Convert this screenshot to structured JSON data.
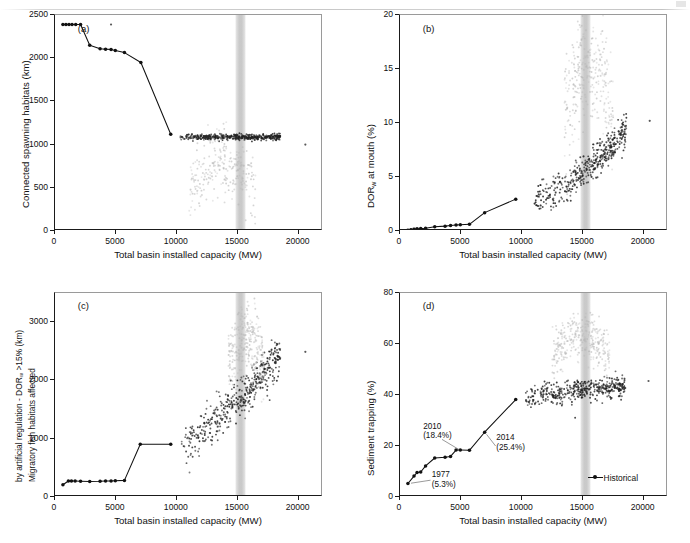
{
  "figure": {
    "width": 690,
    "height": 543,
    "background": "#ffffff",
    "shared_xlabel": "Total basin installed capacity (MW)",
    "legend_label": "Historical",
    "band_color": "#bcbcbc",
    "line_color": "#111111",
    "scatter_dark": "#222222",
    "scatter_light": "#b8b8b8"
  },
  "chart_data": [
    {
      "type": "scatter",
      "panel": "a",
      "tag": "(a)",
      "title": "",
      "xlabel": "Total basin installed capacity (MW)",
      "ylabel": "Connected spawning habitats (km)",
      "xlim": [
        0,
        22000
      ],
      "ylim": [
        0,
        2500
      ],
      "xticks": [
        0,
        5000,
        10000,
        15000,
        20000
      ],
      "xticklabels": [
        "0",
        "5000",
        "10000",
        "15000",
        "20000"
      ],
      "yticks": [
        0,
        500,
        1000,
        1500,
        2000,
        2500
      ],
      "yticklabels": [
        "0",
        "500",
        "1000",
        "1500",
        "2000",
        "2500"
      ],
      "grid": false,
      "legend": false,
      "highlight_band": [
        14800,
        15700
      ],
      "series": [
        {
          "name": "Historical",
          "style": "line-marker",
          "x": [
            650,
            900,
            1150,
            1400,
            1700,
            2100,
            2850,
            3700,
            4150,
            4600,
            4950,
            5700,
            7050,
            9500
          ],
          "y": [
            2390,
            2390,
            2390,
            2390,
            2390,
            2390,
            2150,
            2110,
            2105,
            2100,
            2090,
            2065,
            1950,
            1120
          ]
        },
        {
          "name": "Scenario ensemble (dense band)",
          "style": "scatter-dark",
          "x_range": [
            10200,
            18500
          ],
          "y_range": [
            980,
            1130
          ],
          "n": 420
        },
        {
          "name": "Scenario ensemble (diffuse)",
          "style": "scatter-light",
          "x_range": [
            11000,
            16500
          ],
          "y_range": [
            60,
            980
          ],
          "n": 260
        }
      ],
      "outliers": [
        {
          "x": 4600,
          "y": 2390
        },
        {
          "x": 20550,
          "y": 1000
        }
      ]
    },
    {
      "type": "scatter",
      "panel": "b",
      "tag": "(b)",
      "title": "",
      "xlabel": "Total basin installed capacity (MW)",
      "ylabel": "DORw at mouth (%)",
      "ylabel_base": "DOR",
      "ylabel_sub": "w",
      "ylabel_rest": " at mouth (%)",
      "xlim": [
        0,
        22000
      ],
      "ylim": [
        0,
        20
      ],
      "xticks": [
        0,
        5000,
        10000,
        15000,
        20000
      ],
      "xticklabels": [
        "0",
        "5000",
        "10000",
        "15000",
        "20000"
      ],
      "yticks": [
        0,
        5,
        10,
        15,
        20
      ],
      "yticklabels": [
        "0",
        "5",
        "10",
        "15",
        "20"
      ],
      "grid": false,
      "legend": false,
      "highlight_band": [
        14800,
        15700
      ],
      "series": [
        {
          "name": "Historical",
          "style": "line-marker",
          "x": [
            650,
            900,
            1150,
            1400,
            1700,
            2100,
            2850,
            3700,
            4150,
            4600,
            4950,
            5700,
            6950,
            9500
          ],
          "y": [
            0.08,
            0.12,
            0.16,
            0.2,
            0.22,
            0.26,
            0.4,
            0.45,
            0.5,
            0.55,
            0.58,
            0.62,
            1.7,
            2.95
          ]
        },
        {
          "name": "Scenario ensemble (dense)",
          "style": "scatter-dark",
          "x_range": [
            11000,
            18600
          ],
          "y_range": [
            3.0,
            9.5
          ],
          "n": 430
        },
        {
          "name": "Scenario ensemble (diffuse upper)",
          "style": "scatter-light",
          "x_range": [
            13500,
            17500
          ],
          "y_range": [
            6.0,
            18.0
          ],
          "n": 300
        }
      ],
      "outliers": [
        {
          "x": 20500,
          "y": 10.2
        }
      ]
    },
    {
      "type": "scatter",
      "panel": "c",
      "tag": "(c)",
      "title": "",
      "xlabel": "Total basin installed capacity (MW)",
      "ylabel_line1": "Migratory fish habitats affected",
      "ylabel_line2": "by artificial regulation - DORw >15% (km)",
      "ylabel_line2_base": "by artificial regulation - DOR",
      "ylabel_line2_sub": "w",
      "ylabel_line2_rest": " >15% (km)",
      "xlim": [
        0,
        22000
      ],
      "ylim": [
        0,
        3500
      ],
      "xticks": [
        0,
        5000,
        10000,
        15000,
        20000
      ],
      "xticklabels": [
        "0",
        "5000",
        "10000",
        "15000",
        "20000"
      ],
      "yticks": [
        0,
        1000,
        2000,
        3000
      ],
      "yticklabels": [
        "0",
        "1000",
        "2000",
        "3000"
      ],
      "grid": false,
      "legend": false,
      "highlight_band": [
        14800,
        15700
      ],
      "series": [
        {
          "name": "Historical",
          "style": "line-marker",
          "x": [
            650,
            1100,
            1350,
            1650,
            2100,
            2850,
            3700,
            4150,
            4600,
            4950,
            5700,
            7000,
            9500
          ],
          "y": [
            210,
            275,
            275,
            275,
            270,
            265,
            270,
            275,
            275,
            280,
            285,
            905,
            905
          ]
        },
        {
          "name": "Scenario ensemble (dense)",
          "style": "scatter-dark",
          "x_range": [
            10300,
            18500
          ],
          "y_range": [
            900,
            2450
          ],
          "n": 430
        },
        {
          "name": "Scenario ensemble (diffuse upper)",
          "style": "scatter-light",
          "x_range": [
            14200,
            17200
          ],
          "y_range": [
            1500,
            3050
          ],
          "n": 300
        }
      ],
      "outliers": [
        {
          "x": 20550,
          "y": 2490
        }
      ]
    },
    {
      "type": "scatter",
      "panel": "d",
      "tag": "(d)",
      "title": "",
      "xlabel": "Total basin installed capacity (MW)",
      "ylabel": "Sediment trapping (%)",
      "xlim": [
        0,
        22000
      ],
      "ylim": [
        0,
        80
      ],
      "xticks": [
        0,
        5000,
        10000,
        15000,
        20000
      ],
      "xticklabels": [
        "0",
        "5000",
        "10000",
        "15000",
        "20000"
      ],
      "yticks": [
        0,
        20,
        40,
        60,
        80
      ],
      "yticklabels": [
        "0",
        "20",
        "40",
        "60",
        "80"
      ],
      "grid": false,
      "legend": true,
      "legend_entries": [
        "Historical"
      ],
      "legend_position": "lower right",
      "highlight_band": [
        14800,
        15700
      ],
      "series": [
        {
          "name": "Historical",
          "style": "line-marker",
          "x": [
            650,
            1150,
            1400,
            1700,
            2100,
            2850,
            3700,
            4150,
            4600,
            4950,
            5700,
            6950,
            9500
          ],
          "y": [
            5.3,
            8.2,
            9.6,
            9.8,
            12.2,
            15.3,
            15.6,
            15.9,
            18.4,
            18.4,
            18.3,
            25.4,
            38.2
          ]
        },
        {
          "name": "Scenario ensemble (dense)",
          "style": "scatter-dark",
          "x_range": [
            10300,
            18500
          ],
          "y_range": [
            38.0,
            48.0
          ],
          "n": 430
        },
        {
          "name": "Scenario ensemble (diffuse upper)",
          "style": "scatter-light",
          "x_range": [
            12500,
            17200
          ],
          "y_range": [
            44.0,
            68.0
          ],
          "n": 320
        }
      ],
      "outliers": [
        {
          "x": 20400,
          "y": 45.5
        }
      ],
      "annotations": [
        {
          "label": "1977",
          "value": "(5.3%)",
          "point": [
            650,
            5.3
          ]
        },
        {
          "label": "2010",
          "value": "(18.4%)",
          "point": [
            4950,
            18.4
          ]
        },
        {
          "label": "2014",
          "value": "(25.4%)",
          "point": [
            6950,
            25.4
          ]
        }
      ]
    }
  ]
}
